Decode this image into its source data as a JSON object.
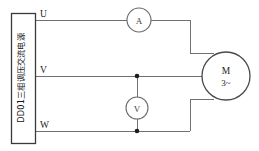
{
  "diagram": {
    "canvas": {
      "width": 259,
      "height": 151
    },
    "colors": {
      "background": "#ffffff",
      "wire": "#707070",
      "outline": "#3a3a3a",
      "node": "#1d1d1d",
      "text": "#222222"
    }
  },
  "power_supply": {
    "name": "power-supply-box",
    "label": "DD01三相调压交流电源",
    "label_orientation": "vertical-bottom-to-top",
    "terminals": [
      {
        "id": "U",
        "label": "U",
        "y": 20
      },
      {
        "id": "V",
        "label": "V",
        "y": 76
      },
      {
        "id": "W",
        "label": "W",
        "y": 131
      }
    ]
  },
  "instruments": {
    "ammeter": {
      "label": "A",
      "name": "ammeter",
      "type": "ammeter",
      "cx": 139,
      "cy": 20,
      "r": 12
    },
    "voltmeter": {
      "label": "V",
      "name": "voltmeter",
      "type": "voltmeter",
      "cx": 137,
      "cy": 108,
      "r": 11
    }
  },
  "motor": {
    "name": "three-phase-motor",
    "label": "M",
    "sub_label": "3~",
    "cx": 226,
    "cy": 76,
    "r": 24
  },
  "junctions": [
    {
      "name": "junction-v-line",
      "x": 137,
      "y": 76
    },
    {
      "name": "junction-w-line",
      "x": 137,
      "y": 131
    }
  ],
  "connections": [
    {
      "from": "U",
      "through": "ammeter",
      "to": "motor-top"
    },
    {
      "from": "V",
      "through": "voltmeter-top",
      "to": "motor-left"
    },
    {
      "from": "W",
      "through": "voltmeter-bottom",
      "to": "motor-bottom"
    }
  ]
}
